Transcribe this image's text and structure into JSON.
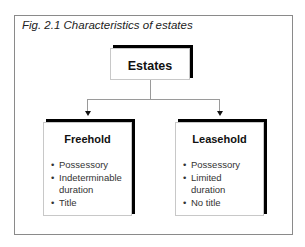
{
  "figure": {
    "title": "Fig. 2.1  Characteristics of estates"
  },
  "root": {
    "label": "Estates"
  },
  "children": [
    {
      "label": "Freehold",
      "items": [
        "Possessory",
        "Indeterminable duration",
        "Title"
      ]
    },
    {
      "label": "Leasehold",
      "items": [
        "Possessory",
        "Limited duration",
        "No title"
      ]
    }
  ]
}
